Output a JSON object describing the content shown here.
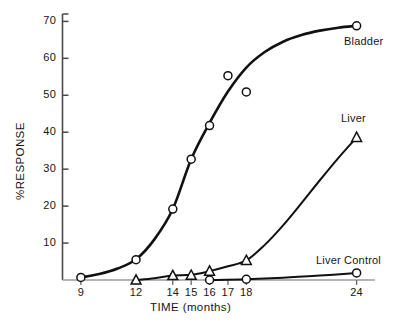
{
  "chart_data": {
    "type": "line",
    "title": "",
    "xlabel": "TIME (months)",
    "ylabel": "%RESPONSE",
    "xlim": [
      8,
      25
    ],
    "ylim": [
      0,
      72
    ],
    "grid": false,
    "legend_position": "inline-right-of-curve-ends",
    "x_ticks": [
      9,
      12,
      14,
      15,
      16,
      17,
      18,
      24
    ],
    "x_tick_labels": [
      "9",
      "12",
      "14",
      "15",
      "16",
      "17",
      "18",
      "24"
    ],
    "y_ticks": [
      10,
      20,
      30,
      40,
      50,
      60,
      70
    ],
    "y_tick_labels": [
      "10",
      "20",
      "30",
      "40",
      "50",
      "60",
      "70"
    ],
    "series": [
      {
        "name": "Bladder",
        "marker": "circle-open",
        "label": "Bladder",
        "points": [
          {
            "x": 9,
            "y": 0.7
          },
          {
            "x": 12,
            "y": 5.5
          },
          {
            "x": 14,
            "y": 19.2
          },
          {
            "x": 15,
            "y": 32.7
          },
          {
            "x": 16,
            "y": 41.8
          },
          {
            "x": 17,
            "y": 55.3
          },
          {
            "x": 18,
            "y": 50.9
          },
          {
            "x": 24,
            "y": 68.8
          }
        ],
        "curve": [
          {
            "x": 9,
            "y": 0.7
          },
          {
            "x": 10,
            "y": 1.6
          },
          {
            "x": 11,
            "y": 3.1
          },
          {
            "x": 12,
            "y": 5.6
          },
          {
            "x": 13,
            "y": 11.0
          },
          {
            "x": 14,
            "y": 19.2
          },
          {
            "x": 15,
            "y": 32.7
          },
          {
            "x": 16,
            "y": 42.5
          },
          {
            "x": 17,
            "y": 51.0
          },
          {
            "x": 18,
            "y": 57.5
          },
          {
            "x": 19,
            "y": 61.7
          },
          {
            "x": 20,
            "y": 64.5
          },
          {
            "x": 21,
            "y": 66.3
          },
          {
            "x": 22,
            "y": 67.5
          },
          {
            "x": 23,
            "y": 68.3
          },
          {
            "x": 24,
            "y": 68.8
          }
        ]
      },
      {
        "name": "Liver",
        "marker": "triangle-open",
        "label": "Liver",
        "points": [
          {
            "x": 12,
            "y": 0.0
          },
          {
            "x": 14,
            "y": 1.2
          },
          {
            "x": 15,
            "y": 1.3
          },
          {
            "x": 16,
            "y": 2.4
          },
          {
            "x": 18,
            "y": 5.3
          },
          {
            "x": 24,
            "y": 38.6
          }
        ],
        "curve": [
          {
            "x": 12,
            "y": 0.0
          },
          {
            "x": 13,
            "y": 0.5
          },
          {
            "x": 14,
            "y": 1.2
          },
          {
            "x": 15,
            "y": 1.4
          },
          {
            "x": 16,
            "y": 2.4
          },
          {
            "x": 17,
            "y": 3.7
          },
          {
            "x": 18,
            "y": 5.3
          },
          {
            "x": 19,
            "y": 9.5
          },
          {
            "x": 20,
            "y": 14.8
          },
          {
            "x": 21,
            "y": 20.8
          },
          {
            "x": 22,
            "y": 27.0
          },
          {
            "x": 23,
            "y": 33.0
          },
          {
            "x": 24,
            "y": 38.6
          }
        ]
      },
      {
        "name": "Liver Control",
        "marker": "circle-open",
        "label": "Liver Control",
        "points": [
          {
            "x": 16,
            "y": 0.0
          },
          {
            "x": 18,
            "y": 0.2
          },
          {
            "x": 24,
            "y": 1.9
          }
        ],
        "curve": [
          {
            "x": 16,
            "y": 0.0
          },
          {
            "x": 18,
            "y": 0.2
          },
          {
            "x": 20,
            "y": 0.6
          },
          {
            "x": 22,
            "y": 1.2
          },
          {
            "x": 24,
            "y": 1.9
          }
        ]
      }
    ]
  }
}
